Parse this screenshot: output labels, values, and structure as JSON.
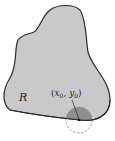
{
  "diagram": {
    "region_label": "R",
    "point_label": "(x0, y0)",
    "point_label_x": "x",
    "point_label_x_sub": "0",
    "point_label_y": "y",
    "point_label_y_sub": "0",
    "colors": {
      "region_fill": "#c9c9c9",
      "region_stroke": "#2a2a2a",
      "disk_inside_fill": "#8f8f8f",
      "disk_outline": "#8a8a8a",
      "background": "#ffffff"
    }
  }
}
